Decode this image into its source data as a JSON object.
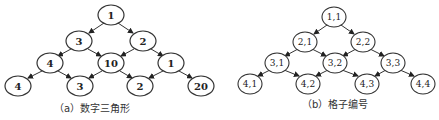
{
  "diagram_a": {
    "caption": "（a）数字三角形",
    "rows": [
      [
        "1"
      ],
      [
        "3",
        "2"
      ],
      [
        "4",
        "10",
        "1"
      ],
      [
        "4",
        "3",
        "2",
        "20"
      ]
    ]
  },
  "diagram_b": {
    "caption": "（b）格子编号",
    "rows": [
      [
        "1,1"
      ],
      [
        "2,1",
        "2,2"
      ],
      [
        "3,1",
        "3,2",
        "3,3"
      ],
      [
        "4,1",
        "4,2",
        "4,3",
        "4,4"
      ]
    ]
  },
  "colors": {
    "stroke": "#333333",
    "fill": "#ffffff",
    "text": "#222222"
  }
}
